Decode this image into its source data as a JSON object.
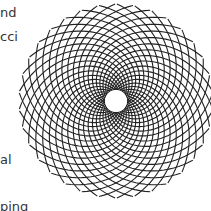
{
  "text_fragments": [
    {
      "text": "nd",
      "x": 0,
      "y": 6
    },
    {
      "text": "cci",
      "x": 0,
      "y": 30
    },
    {
      "text": "al",
      "x": 0,
      "y": 153
    },
    {
      "text": "ping",
      "x": 0,
      "y": 200
    }
  ],
  "figure": {
    "type": "fibonacci-spiral-lattice",
    "center": [
      116,
      101
    ],
    "inner_radius": 11,
    "outer_radius": 97,
    "curves_per_family": 34,
    "stroke_color": "#222222",
    "background": "#ffffff"
  }
}
